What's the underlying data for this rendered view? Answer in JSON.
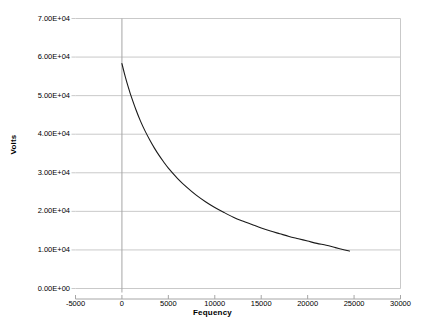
{
  "chart_data": {
    "type": "line",
    "title": "",
    "xlabel": "Fequency",
    "ylabel": "Volts",
    "xlim": [
      -5000,
      30000
    ],
    "ylim": [
      0,
      70000
    ],
    "xticks": [
      -5000,
      0,
      5000,
      10000,
      15000,
      20000,
      25000,
      30000
    ],
    "xtick_labels": [
      "-5000",
      "0",
      "5000",
      "10000",
      "15000",
      "20000",
      "25000",
      "30000"
    ],
    "yticks": [
      0,
      10000,
      20000,
      30000,
      40000,
      50000,
      60000,
      70000
    ],
    "ytick_labels": [
      "0.00E+00",
      "1.00E+04",
      "2.00E+04",
      "3.00E+04",
      "4.00E+04",
      "5.00E+04",
      "6.00E+04",
      "7.00E+04"
    ],
    "grid": "horizontal",
    "legend": "none",
    "series": [
      {
        "name": "Volts vs Fequency",
        "color": "#1a1a1a",
        "x": [
          0,
          250,
          500,
          750,
          1000,
          1500,
          2000,
          2500,
          3000,
          3500,
          4000,
          4500,
          5000,
          6000,
          7000,
          8000,
          9000,
          10000,
          11000,
          12000,
          13000,
          14000,
          15000,
          16000,
          17000,
          18000,
          19000,
          20000,
          21000,
          22000,
          23000,
          24000,
          24500
        ],
        "y": [
          58300,
          55900,
          53700,
          51700,
          49800,
          46400,
          43400,
          40800,
          38500,
          36400,
          34500,
          32800,
          31200,
          28500,
          26200,
          24200,
          22500,
          21000,
          19700,
          18500,
          17500,
          16600,
          15700,
          14900,
          14200,
          13500,
          12900,
          12300,
          11700,
          11200,
          10600,
          10000,
          9700
        ]
      }
    ]
  },
  "axis": {
    "xlabel": "Fequency",
    "ylabel": "Volts"
  },
  "colors": {
    "series_line": "#1a1a1a",
    "gridline": "#c9c9c9",
    "axis_line": "#a6a6a6",
    "plot_background": "#ffffff",
    "text": "#000000"
  }
}
